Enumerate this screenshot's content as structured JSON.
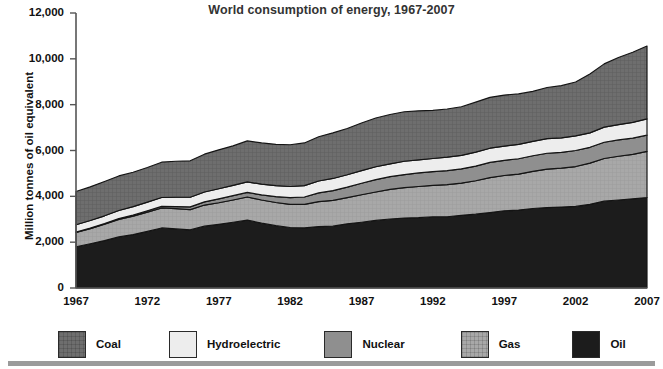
{
  "chart_data": {
    "type": "area",
    "stacked": true,
    "title": "World consumption of energy, 1967-2007",
    "xlabel": "",
    "ylabel": "Million tonnes of oil equivalent",
    "ylim": [
      0,
      12000
    ],
    "xlim": [
      1967,
      2007
    ],
    "grid": false,
    "legend_position": "bottom",
    "ytick_labels": [
      "12,000",
      "10,000",
      "8,000",
      "6,000",
      "4,000",
      "2,000",
      "0"
    ],
    "ytick_values": [
      12000,
      10000,
      8000,
      6000,
      4000,
      2000,
      0
    ],
    "xtick_labels": [
      "1967",
      "1972",
      "1977",
      "1982",
      "1987",
      "1992",
      "1997",
      "2002",
      "2007"
    ],
    "xtick_values": [
      1967,
      1972,
      1977,
      1982,
      1987,
      1992,
      1997,
      2002,
      2007
    ],
    "x": [
      1967,
      1968,
      1969,
      1970,
      1971,
      1972,
      1973,
      1974,
      1975,
      1976,
      1977,
      1978,
      1979,
      1980,
      1981,
      1982,
      1983,
      1984,
      1985,
      1986,
      1987,
      1988,
      1989,
      1990,
      1991,
      1992,
      1993,
      1994,
      1995,
      1996,
      1997,
      1998,
      1999,
      2000,
      2001,
      2002,
      2003,
      2004,
      2005,
      2006,
      2007
    ],
    "series": [
      {
        "name": "Oil",
        "color": "#1c1c1c",
        "order": 1,
        "values": [
          1800,
          1930,
          2070,
          2230,
          2330,
          2470,
          2620,
          2580,
          2540,
          2700,
          2780,
          2870,
          2960,
          2830,
          2720,
          2640,
          2620,
          2680,
          2700,
          2800,
          2870,
          2950,
          3010,
          3050,
          3070,
          3110,
          3110,
          3170,
          3220,
          3290,
          3370,
          3400,
          3470,
          3510,
          3530,
          3560,
          3650,
          3790,
          3840,
          3890,
          3950
        ]
      },
      {
        "name": "Gas",
        "color": "#a8a8a8",
        "order": 2,
        "values": [
          620,
          660,
          710,
          760,
          800,
          840,
          870,
          880,
          880,
          920,
          940,
          970,
          1010,
          1010,
          1010,
          1010,
          1030,
          1090,
          1120,
          1140,
          1200,
          1240,
          1290,
          1330,
          1360,
          1370,
          1400,
          1410,
          1460,
          1530,
          1540,
          1570,
          1620,
          1680,
          1700,
          1740,
          1800,
          1860,
          1910,
          1940,
          2010
        ]
      },
      {
        "name": "Nuclear",
        "color": "#8f8f8f",
        "order": 3,
        "values": [
          20,
          25,
          30,
          40,
          50,
          60,
          70,
          90,
          120,
          140,
          170,
          190,
          200,
          220,
          260,
          290,
          320,
          380,
          430,
          460,
          500,
          540,
          560,
          570,
          590,
          600,
          610,
          620,
          640,
          660,
          660,
          670,
          680,
          690,
          690,
          700,
          690,
          710,
          710,
          710,
          710
        ]
      },
      {
        "name": "Hydroelectric",
        "color": "#ededed",
        "order": 4,
        "values": [
          320,
          330,
          340,
          350,
          370,
          380,
          390,
          410,
          420,
          430,
          440,
          450,
          460,
          470,
          480,
          490,
          500,
          520,
          530,
          540,
          550,
          560,
          560,
          580,
          570,
          570,
          590,
          590,
          610,
          620,
          620,
          630,
          630,
          640,
          630,
          640,
          630,
          660,
          670,
          690,
          710
        ]
      },
      {
        "name": "Coal",
        "color": "#6e6e6e",
        "order": 5,
        "values": [
          1450,
          1470,
          1500,
          1510,
          1500,
          1510,
          1540,
          1570,
          1590,
          1650,
          1700,
          1720,
          1790,
          1800,
          1800,
          1820,
          1860,
          1930,
          1990,
          2020,
          2080,
          2130,
          2150,
          2160,
          2140,
          2100,
          2100,
          2120,
          2180,
          2220,
          2230,
          2200,
          2180,
          2230,
          2280,
          2350,
          2570,
          2760,
          2930,
          3060,
          3180
        ]
      }
    ],
    "totals": [
      4210,
      4415,
      4650,
      4890,
      5050,
      5260,
      5490,
      5530,
      5550,
      5840,
      6030,
      6200,
      6420,
      6330,
      6270,
      6250,
      6330,
      6600,
      6770,
      6960,
      7200,
      7420,
      7570,
      7690,
      7730,
      7750,
      7810,
      7910,
      8110,
      8320,
      8420,
      8470,
      8580,
      8750,
      8830,
      8990,
      9340,
      9780,
      10060,
      10290,
      10560
    ],
    "annotations": []
  },
  "legend": {
    "items": [
      {
        "label": "Coal",
        "color": "#6e6e6e",
        "pattern": "crosshatch"
      },
      {
        "label": "Hydroelectric",
        "color": "#ededed",
        "pattern": "solid"
      },
      {
        "label": "Nuclear",
        "color": "#8f8f8f",
        "pattern": "solid"
      },
      {
        "label": "Gas",
        "color": "#a8a8a8",
        "pattern": "crosshatch"
      },
      {
        "label": "Oil",
        "color": "#1c1c1c",
        "pattern": "solid"
      }
    ]
  }
}
